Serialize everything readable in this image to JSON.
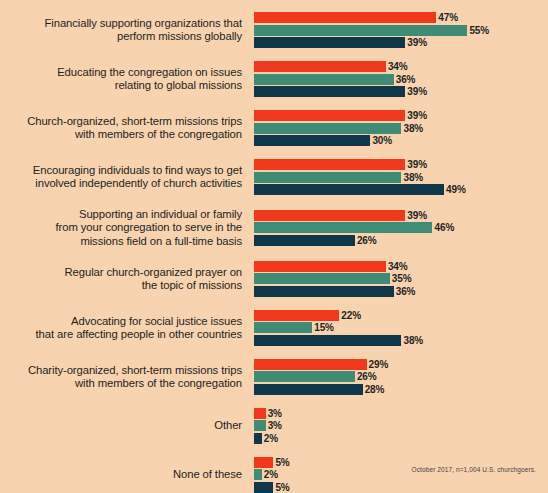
{
  "footnote": "October 2017, n=1,004 U.S. churchgoers.",
  "colors": {
    "background": "#F7D3B0",
    "series_red": "#F0381C",
    "series_green": "#3F8B73",
    "series_navy": "#10364A",
    "text": "#241F1C"
  },
  "chart_data": {
    "type": "bar",
    "title": "",
    "subtitle": "",
    "xlabel": "",
    "ylabel": "",
    "orientation": "horizontal",
    "grouped": true,
    "grid": false,
    "legend_position": "none",
    "xlim": [
      0,
      55
    ],
    "value_suffix": "%",
    "note": "October 2017, n=1,004 U.S. churchgoers.",
    "categories": [
      "Financially supporting organizations that perform missions globally",
      "Educating the congregation on issues relating to global missions",
      "Church-organized, short-term missions trips with members of the congregation",
      "Encouraging individuals to find ways to get involved independently of church activities",
      "Supporting an individual or family from your congregation to serve in the missions field on a full-time basis",
      "Regular church-organized prayer on the topic of missions",
      "Advocating for social justice issues that are affecting people in other countries",
      "Charity-organized, short-term missions trips with members of the congregation",
      "Other",
      "None of these"
    ],
    "series": [
      {
        "name": "series-1",
        "color": "#F0381C",
        "values": [
          47,
          34,
          39,
          39,
          39,
          34,
          22,
          29,
          3,
          5
        ]
      },
      {
        "name": "series-2",
        "color": "#3F8B73",
        "values": [
          55,
          36,
          38,
          38,
          46,
          35,
          15,
          26,
          3,
          2
        ]
      },
      {
        "name": "series-3",
        "color": "#10364A",
        "values": [
          39,
          39,
          30,
          49,
          26,
          36,
          38,
          28,
          2,
          5
        ]
      }
    ]
  },
  "rows": [
    {
      "label_lines": [
        "Financially supporting organizations that",
        "perform missions globally"
      ],
      "bars": [
        {
          "value": 47,
          "label": "47%",
          "series": 0
        },
        {
          "value": 55,
          "label": "55%",
          "series": 1
        },
        {
          "value": 39,
          "label": "39%",
          "series": 2
        }
      ]
    },
    {
      "label_lines": [
        "Educating the congregation on issues",
        "relating to global missions"
      ],
      "bars": [
        {
          "value": 34,
          "label": "34%",
          "series": 0
        },
        {
          "value": 36,
          "label": "36%",
          "series": 1
        },
        {
          "value": 39,
          "label": "39%",
          "series": 2
        }
      ]
    },
    {
      "label_lines": [
        "Church-organized, short-term missions trips",
        "with members of the congregation"
      ],
      "bars": [
        {
          "value": 39,
          "label": "39%",
          "series": 0
        },
        {
          "value": 38,
          "label": "38%",
          "series": 1
        },
        {
          "value": 30,
          "label": "30%",
          "series": 2
        }
      ]
    },
    {
      "label_lines": [
        "Encouraging individuals to find ways to get",
        "involved independently of church activities"
      ],
      "bars": [
        {
          "value": 39,
          "label": "39%",
          "series": 0
        },
        {
          "value": 38,
          "label": "38%",
          "series": 1
        },
        {
          "value": 49,
          "label": "49%",
          "series": 2
        }
      ]
    },
    {
      "label_lines": [
        "Supporting an individual or family",
        "from your congregation to serve in the",
        "missions field on a full-time basis"
      ],
      "bars": [
        {
          "value": 39,
          "label": "39%",
          "series": 0
        },
        {
          "value": 46,
          "label": "46%",
          "series": 1
        },
        {
          "value": 26,
          "label": "26%",
          "series": 2
        }
      ]
    },
    {
      "label_lines": [
        "Regular church-organized prayer on",
        "the topic of missions"
      ],
      "bars": [
        {
          "value": 34,
          "label": "34%",
          "series": 0
        },
        {
          "value": 35,
          "label": "35%",
          "series": 1
        },
        {
          "value": 36,
          "label": "36%",
          "series": 2
        }
      ]
    },
    {
      "label_lines": [
        "Advocating for social justice issues",
        "that are affecting people in other countries"
      ],
      "bars": [
        {
          "value": 22,
          "label": "22%",
          "series": 0
        },
        {
          "value": 15,
          "label": "15%",
          "series": 1
        },
        {
          "value": 38,
          "label": "38%",
          "series": 2
        }
      ]
    },
    {
      "label_lines": [
        "Charity-organized, short-term missions trips",
        "with members of the congregation"
      ],
      "bars": [
        {
          "value": 29,
          "label": "29%",
          "series": 0
        },
        {
          "value": 26,
          "label": "26%",
          "series": 1
        },
        {
          "value": 28,
          "label": "28%",
          "series": 2
        }
      ]
    },
    {
      "label_lines": [
        "Other"
      ],
      "bars": [
        {
          "value": 3,
          "label": "3%",
          "series": 0
        },
        {
          "value": 3,
          "label": "3%",
          "series": 1
        },
        {
          "value": 2,
          "label": "2%",
          "series": 2
        }
      ]
    },
    {
      "label_lines": [
        "None of these"
      ],
      "bars": [
        {
          "value": 5,
          "label": "5%",
          "series": 0
        },
        {
          "value": 2,
          "label": "2%",
          "series": 1
        },
        {
          "value": 5,
          "label": "5%",
          "series": 2
        }
      ]
    }
  ]
}
